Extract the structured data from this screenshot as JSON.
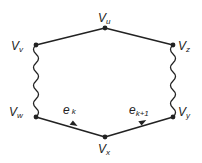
{
  "diagram": {
    "nodes": [
      {
        "id": "u",
        "label": "V",
        "sub": "u"
      },
      {
        "id": "v",
        "label": "V",
        "sub": "v"
      },
      {
        "id": "z",
        "label": "V",
        "sub": "z"
      },
      {
        "id": "w",
        "label": "V",
        "sub": "w"
      },
      {
        "id": "y",
        "label": "V",
        "sub": "y"
      },
      {
        "id": "x",
        "label": "V",
        "sub": "x"
      }
    ],
    "edges": [
      {
        "from": "v",
        "to": "u",
        "style": "straight"
      },
      {
        "from": "u",
        "to": "z",
        "style": "straight"
      },
      {
        "from": "v",
        "to": "w",
        "style": "wavy"
      },
      {
        "from": "z",
        "to": "y",
        "style": "wavy"
      },
      {
        "from": "w",
        "to": "x",
        "style": "arrow",
        "label": "e",
        "sub": "k"
      },
      {
        "from": "x",
        "to": "y",
        "style": "arrow",
        "label": "e",
        "sub": "k+1"
      }
    ],
    "colors": {
      "line": "#222222"
    }
  }
}
